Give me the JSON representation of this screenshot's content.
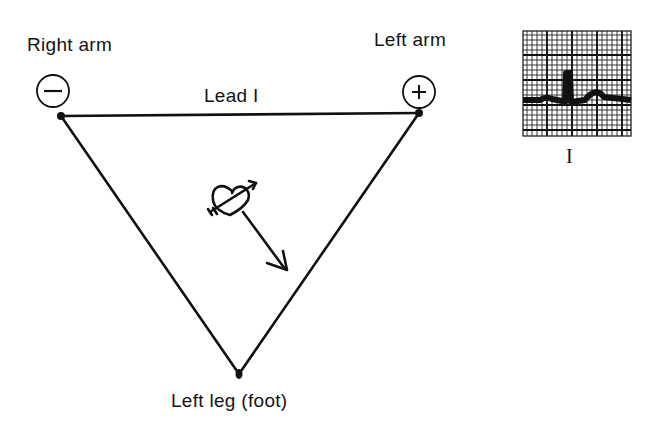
{
  "diagram": {
    "labels": {
      "right_arm": "Right arm",
      "left_arm": "Left arm",
      "lead": "Lead I",
      "left_leg": "Left leg (foot)"
    },
    "electrodes": {
      "right_arm_polarity": "−",
      "left_arm_polarity": "+"
    },
    "ecg_strip": {
      "label": "I",
      "waveform": [
        "P wave",
        "QRS complex (upright R)",
        "T wave"
      ]
    },
    "heart": {
      "icon": "heart-with-arrow-icon",
      "vector": "arrow pointing down-right toward left leg"
    },
    "colors": {
      "ink": "#111111",
      "background": "#ffffff"
    }
  }
}
